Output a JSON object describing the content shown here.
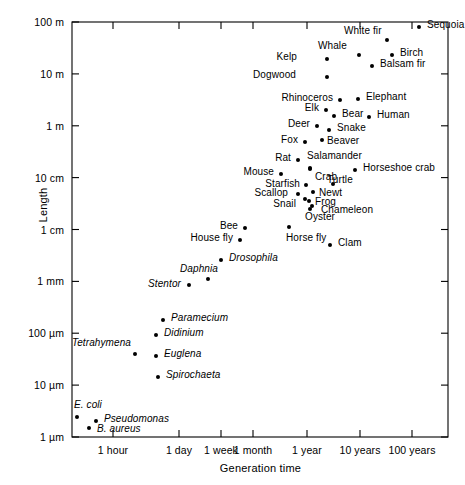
{
  "chart_data": {
    "type": "scatter",
    "title": "",
    "xlabel": "Generation time",
    "ylabel": "Length",
    "grid": false,
    "legend": null,
    "x_scale": "log-time",
    "y_scale": "log-length",
    "x_ticks": [
      "1 hour",
      "1 day",
      "1 week",
      "1 month",
      "1 year",
      "10 years",
      "100 years"
    ],
    "y_ticks": [
      "100 m",
      "10 m",
      "1 m",
      "10 cm",
      "1 cm",
      "1 mm",
      "100 µm",
      "10 µm",
      "1 µm"
    ],
    "points": [
      {
        "name": "Sequoia",
        "generation_time": "100 years",
        "length": "100 m",
        "italic": false,
        "px": 419,
        "py": 27,
        "lx": 427,
        "ly": 24,
        "align": "left"
      },
      {
        "name": "White fir",
        "generation_time": "40 years",
        "length": "60 m",
        "italic": false,
        "px": 387,
        "py": 40,
        "lx": 344,
        "ly": 30,
        "align": "left"
      },
      {
        "name": "Whale",
        "generation_time": "12 years",
        "length": "25 m",
        "italic": false,
        "px": 359,
        "py": 55,
        "lx": 318,
        "ly": 45,
        "align": "left"
      },
      {
        "name": "Birch",
        "generation_time": "30 years",
        "length": "22 m",
        "italic": false,
        "px": 392,
        "py": 55,
        "lx": 400,
        "ly": 52,
        "align": "left"
      },
      {
        "name": "Kelp",
        "generation_time": "5 years",
        "length": "20 m",
        "italic": false,
        "px": 327,
        "py": 59,
        "lx": 297,
        "ly": 56,
        "align": "right"
      },
      {
        "name": "Balsam fir",
        "generation_time": "22 years",
        "length": "15 m",
        "italic": false,
        "px": 372,
        "py": 66,
        "lx": 380,
        "ly": 63,
        "align": "left"
      },
      {
        "name": "Dogwood",
        "generation_time": "5 years",
        "length": "8 m",
        "italic": false,
        "px": 327,
        "py": 77,
        "lx": 296,
        "ly": 74,
        "align": "right"
      },
      {
        "name": "Rhinoceros",
        "generation_time": "6 years",
        "length": "3 m",
        "italic": false,
        "px": 340,
        "py": 100,
        "lx": 333,
        "ly": 97,
        "align": "right"
      },
      {
        "name": "Elephant",
        "generation_time": "12 years",
        "length": "3 m",
        "italic": false,
        "px": 358,
        "py": 99,
        "lx": 366,
        "ly": 96,
        "align": "left"
      },
      {
        "name": "Elk",
        "generation_time": "4 years",
        "length": "2.2 m",
        "italic": false,
        "px": 326,
        "py": 110,
        "lx": 319,
        "ly": 107,
        "align": "right"
      },
      {
        "name": "Bear",
        "generation_time": "5 years",
        "length": "1.8 m",
        "italic": false,
        "px": 334,
        "py": 116,
        "lx": 342,
        "ly": 113,
        "align": "left"
      },
      {
        "name": "Human",
        "generation_time": "15 years",
        "length": "1.7 m",
        "italic": false,
        "px": 369,
        "py": 117,
        "lx": 377,
        "ly": 114,
        "align": "left"
      },
      {
        "name": "Deer",
        "generation_time": "3 years",
        "length": "1.5 m",
        "italic": false,
        "px": 317,
        "py": 126,
        "lx": 310,
        "ly": 123,
        "align": "right"
      },
      {
        "name": "Snake",
        "generation_time": "4 years",
        "length": "1.3 m",
        "italic": false,
        "px": 329,
        "py": 130,
        "lx": 337,
        "ly": 127,
        "align": "left"
      },
      {
        "name": "Fox",
        "generation_time": "2 years",
        "length": "1 m",
        "italic": false,
        "px": 305,
        "py": 142,
        "lx": 298,
        "ly": 139,
        "align": "right"
      },
      {
        "name": "Beaver",
        "generation_time": "3 years",
        "length": "1 m",
        "italic": false,
        "px": 322,
        "py": 140,
        "lx": 327,
        "ly": 140,
        "align": "left"
      },
      {
        "name": "Rat",
        "generation_time": "1 year",
        "length": "22 cm",
        "italic": false,
        "px": 298,
        "py": 160,
        "lx": 291,
        "ly": 157,
        "align": "right"
      },
      {
        "name": "Salamander",
        "generation_time": "1.5 years",
        "length": "20 cm",
        "italic": false,
        "px": 310,
        "py": 168,
        "lx": 307,
        "ly": 155,
        "align": "left"
      },
      {
        "name": "Horseshoe crab",
        "generation_time": "7 years",
        "length": "18 cm",
        "italic": false,
        "px": 355,
        "py": 170,
        "lx": 363,
        "ly": 167,
        "align": "left"
      },
      {
        "name": "Mouse",
        "generation_time": "5 months",
        "length": "15 cm",
        "italic": false,
        "px": 281,
        "py": 174,
        "lx": 274,
        "ly": 171,
        "align": "right"
      },
      {
        "name": "Crab",
        "generation_time": "1.6 years",
        "length": "14 cm",
        "italic": false,
        "px": 310,
        "py": 169,
        "lx": 315,
        "ly": 176,
        "align": "left"
      },
      {
        "name": "Turtle",
        "generation_time": "3 years",
        "length": "12 cm",
        "italic": false,
        "px": 333,
        "py": 184,
        "lx": 327,
        "ly": 179,
        "align": "left"
      },
      {
        "name": "Starfish",
        "generation_time": "1.3 years",
        "length": "9 cm",
        "italic": false,
        "px": 306,
        "py": 185,
        "lx": 300,
        "ly": 183,
        "align": "right"
      },
      {
        "name": "Newt",
        "generation_time": "2 years",
        "length": "8 cm",
        "italic": false,
        "px": 313,
        "py": 192,
        "lx": 319,
        "ly": 192,
        "align": "left"
      },
      {
        "name": "Scallop",
        "generation_time": "1.2 years",
        "length": "7 cm",
        "italic": false,
        "px": 298,
        "py": 194,
        "lx": 288,
        "ly": 192,
        "align": "right"
      },
      {
        "name": "Frog",
        "generation_time": "1.8 years",
        "length": "6 cm",
        "italic": false,
        "px": 309,
        "py": 201,
        "lx": 315,
        "ly": 201,
        "align": "left"
      },
      {
        "name": "Snail",
        "generation_time": "1.3 years",
        "length": "5 cm",
        "italic": false,
        "px": 305,
        "py": 199,
        "lx": 296,
        "ly": 203,
        "align": "right"
      },
      {
        "name": "Chameleon",
        "generation_time": "2.2 years",
        "length": "5 cm",
        "italic": false,
        "px": 312,
        "py": 206,
        "lx": 321,
        "ly": 209,
        "align": "left"
      },
      {
        "name": "Oyster",
        "generation_time": "1.4 years",
        "length": "3.5 cm",
        "italic": false,
        "px": 310,
        "py": 209,
        "lx": 305,
        "ly": 216,
        "align": "left"
      },
      {
        "name": "Bee",
        "generation_time": "3 months",
        "length": "1.2 cm",
        "italic": false,
        "px": 245,
        "py": 228,
        "lx": 238,
        "ly": 225,
        "align": "right"
      },
      {
        "name": "Horse fly",
        "generation_time": "8 months",
        "length": "1.2 cm",
        "italic": false,
        "px": 289,
        "py": 227,
        "lx": 286,
        "ly": 237,
        "align": "left"
      },
      {
        "name": "House fly",
        "generation_time": "2 months",
        "length": "8 mm",
        "italic": false,
        "px": 240,
        "py": 240,
        "lx": 233,
        "ly": 237,
        "align": "right"
      },
      {
        "name": "Clam",
        "generation_time": "1.2 years",
        "length": "6 mm",
        "italic": false,
        "px": 330,
        "py": 245,
        "lx": 338,
        "ly": 242,
        "align": "left"
      },
      {
        "name": "Drosophila",
        "generation_time": "3 weeks",
        "length": "3 mm",
        "italic": true,
        "px": 221,
        "py": 260,
        "lx": 229,
        "ly": 257,
        "align": "left"
      },
      {
        "name": "Daphnia",
        "generation_time": "2 weeks",
        "length": "1.2 mm",
        "italic": true,
        "px": 208,
        "py": 279,
        "lx": 180,
        "ly": 268,
        "align": "left"
      },
      {
        "name": "Stentor",
        "generation_time": "8 days",
        "length": "0.9 mm",
        "italic": true,
        "px": 189,
        "py": 285,
        "lx": 181,
        "ly": 283,
        "align": "right"
      },
      {
        "name": "Paramecium",
        "generation_time": "5 days",
        "length": "180 µm",
        "italic": true,
        "px": 163,
        "py": 320,
        "lx": 171,
        "ly": 317,
        "align": "left"
      },
      {
        "name": "Didinium",
        "generation_time": "4 days",
        "length": "110 µm",
        "italic": true,
        "px": 156,
        "py": 335,
        "lx": 164,
        "ly": 332,
        "align": "left"
      },
      {
        "name": "Tetrahymena",
        "generation_time": "10 hours",
        "length": "45 µm",
        "italic": true,
        "px": 135,
        "py": 354,
        "lx": 131,
        "ly": 342,
        "align": "right"
      },
      {
        "name": "Euglena",
        "generation_time": "4 days",
        "length": "40 µm",
        "italic": true,
        "px": 156,
        "py": 356,
        "lx": 164,
        "ly": 353,
        "align": "left"
      },
      {
        "name": "Spirochaeta",
        "generation_time": "4.5 days",
        "length": "22 µm",
        "italic": true,
        "px": 158,
        "py": 377,
        "lx": 166,
        "ly": 374,
        "align": "left"
      },
      {
        "name": "E. coli",
        "generation_time": "25 min",
        "length": "4 µm",
        "italic": true,
        "px": 77,
        "py": 417,
        "lx": 74,
        "ly": 404,
        "align": "left"
      },
      {
        "name": "Pseudomonas",
        "generation_time": "1 hour",
        "length": "3 µm",
        "italic": true,
        "px": 96,
        "py": 421,
        "lx": 104,
        "ly": 418,
        "align": "left"
      },
      {
        "name": "B. aureus",
        "generation_time": "50 min",
        "length": "2.2 µm",
        "italic": true,
        "px": 89,
        "py": 428,
        "lx": 97,
        "ly": 428,
        "align": "left"
      }
    ]
  },
  "axes": {
    "y_label": "Length",
    "x_label": "Generation time",
    "y_tick_labels": [
      "100 m",
      "10 m",
      "1 m",
      "10 cm",
      "1 cm",
      "1 mm",
      "100 µm",
      "10 µm",
      "1 µm"
    ],
    "x_tick_labels": [
      "1 hour",
      "1 day",
      "1 week",
      "1 month",
      "1 year",
      "10 years",
      "100 years"
    ]
  }
}
